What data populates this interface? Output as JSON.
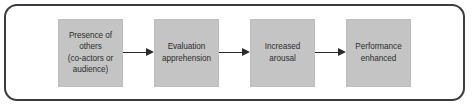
{
  "diagram": {
    "type": "flowchart",
    "orientation": "left-to-right",
    "frame": {
      "shape": "rounded-rectangle",
      "border_color": "#3b3b3f",
      "background_color": "#ffffff"
    },
    "node_style": {
      "fill_color": "#c4c4c4",
      "text_color": "#2e2e2e",
      "shape": "rectangle"
    },
    "arrow_style": {
      "color": "#2b2b2b",
      "head": "solid-triangle",
      "direction": "right"
    },
    "nodes": [
      {
        "id": "node-1",
        "label": "Presence of\nothers\n(co-actors or\naudience)"
      },
      {
        "id": "node-2",
        "label": "Evaluation\napprehension"
      },
      {
        "id": "node-3",
        "label": "Increased\narousal"
      },
      {
        "id": "node-4",
        "label": "Performance\nenhanced"
      }
    ],
    "connectors": [
      {
        "id": "arrow-1",
        "from": "node-1",
        "to": "node-2",
        "glyph": "arrow-right"
      },
      {
        "id": "arrow-2",
        "from": "node-2",
        "to": "node-3",
        "glyph": "arrow-right"
      },
      {
        "id": "arrow-3",
        "from": "node-3",
        "to": "node-4",
        "glyph": "arrow-right"
      }
    ]
  }
}
